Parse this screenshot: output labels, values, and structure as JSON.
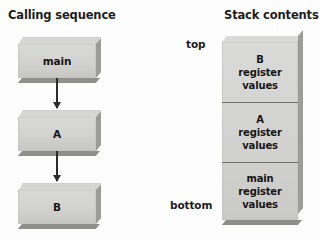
{
  "figure": {
    "left_heading": "Calling sequence",
    "right_heading": "Stack contents"
  },
  "calling_sequence": {
    "boxes": [
      {
        "label": "main"
      },
      {
        "label": "A"
      },
      {
        "label": "B"
      }
    ],
    "arrows": [
      {
        "from": "main",
        "to": "A",
        "direction": "down"
      },
      {
        "from": "A",
        "to": "B",
        "direction": "down"
      }
    ]
  },
  "stack": {
    "top_label": "top",
    "bottom_label": "bottom",
    "cells": [
      {
        "line1": "B",
        "line2": "register",
        "line3": "values"
      },
      {
        "line1": "A",
        "line2": "register",
        "line3": "values"
      },
      {
        "line1": "main",
        "line2": "register",
        "line3": "values"
      }
    ]
  },
  "colors": {
    "background": "#fdfdfd",
    "box_front": "#d3d3d1",
    "box_top": "#d9d9d7",
    "box_side_shadow": "#9b9b98",
    "box_bottom_shadow": "#8f8f8c",
    "divider": "#6e6e6b",
    "text": "#161616",
    "arrow": "#2b2b2b"
  }
}
